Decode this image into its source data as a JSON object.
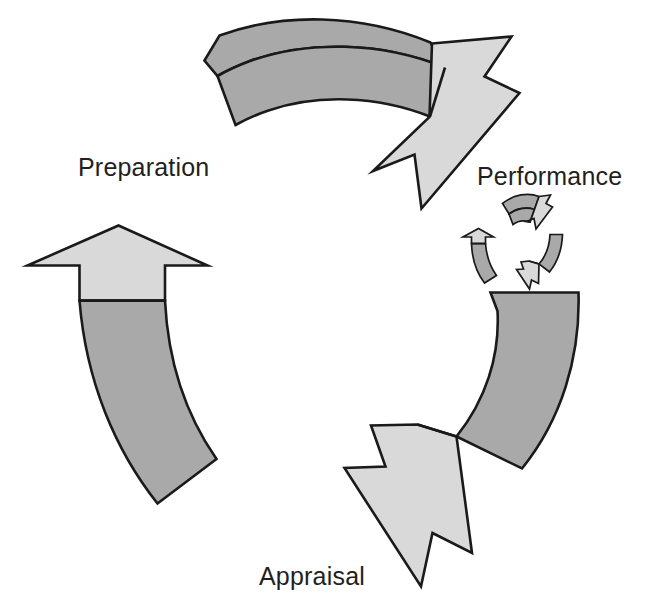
{
  "diagram": {
    "type": "cyclical-process-diagram",
    "stage_count": 3,
    "rotation_direction": "clockwise",
    "colors": {
      "arrow_body_fill": "#a9a9a9",
      "arrow_head_fill": "#d9d9d9",
      "outline": "#1a1a1a",
      "label_text": "#231f20",
      "background": "#ffffff"
    },
    "labels": {
      "preparation": "Preparation",
      "performance": "Performance",
      "appraisal": "Appraisal"
    },
    "stages": [
      {
        "id": "preparation",
        "label": "Preparation",
        "position": "left",
        "arrow_name": "preparation-arrow",
        "points_to": "Performance"
      },
      {
        "id": "performance",
        "label": "Performance",
        "position": "top-right",
        "arrow_name": "performance-arrow",
        "points_to": "Appraisal"
      },
      {
        "id": "appraisal",
        "label": "Appraisal",
        "position": "bottom",
        "arrow_name": "appraisal-arrow",
        "points_to": "Preparation"
      }
    ],
    "mini_cycle": {
      "name": "mini-cycle-icon",
      "arrow_count": 3,
      "description": "miniature recurring cycle emblem"
    }
  }
}
